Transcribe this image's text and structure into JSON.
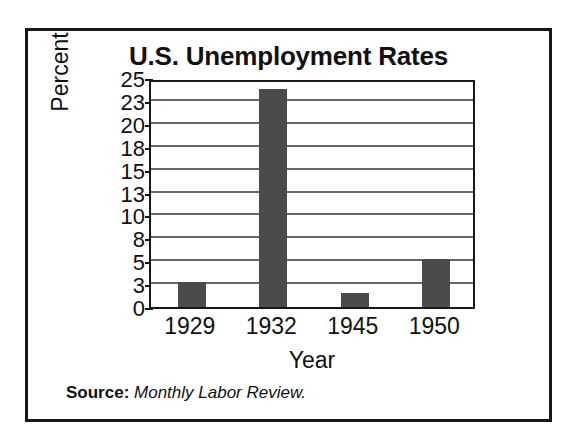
{
  "figure": {
    "border_color": "#171717",
    "background": "#ffffff"
  },
  "source": {
    "label": "Source:",
    "value": "Monthly Labor Review."
  },
  "chart_data": {
    "type": "bar",
    "title": "U.S. Unemployment Rates",
    "xlabel": "Year",
    "ylabel": "Percent",
    "categories": [
      "1929",
      "1932",
      "1945",
      "1950"
    ],
    "values": [
      3.2,
      24.0,
      1.9,
      5.3
    ],
    "series": [
      {
        "name": "Unemployment rate",
        "values": [
          3.2,
          24.0,
          1.9,
          5.3
        ],
        "color": "#4b4b4b"
      }
    ],
    "ytick_labels": [
      "0",
      "3",
      "5",
      "8",
      "10",
      "13",
      "15",
      "18",
      "20",
      "23",
      "25"
    ],
    "ytick_values": [
      0,
      3,
      5,
      8,
      10,
      13,
      15,
      18,
      20,
      23,
      25
    ],
    "ylim": [
      0,
      25
    ],
    "y_axis_scale": "categorical-even-spacing",
    "grid": true,
    "grid_color": "#666666",
    "legend": "none",
    "bar_color": "#4b4b4b"
  }
}
